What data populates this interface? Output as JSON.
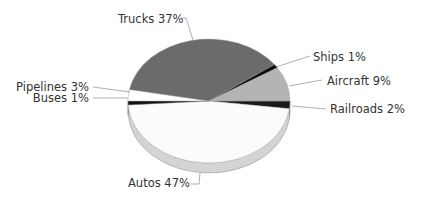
{
  "chart_data": {
    "type": "pie",
    "style": "3d-tilted",
    "title": "",
    "start_angle_deg": 0,
    "direction": "clockwise",
    "slices": [
      {
        "label": "Railroads",
        "value": 2,
        "color": "#1a1a1a",
        "side": "#0f0f0f",
        "text": "Railroads 2%",
        "lx": 330,
        "ly": 113,
        "anchor": "start",
        "line": [
          [
            292,
            106
          ],
          [
            326,
            109
          ]
        ]
      },
      {
        "label": "Autos",
        "value": 47,
        "color": "#fbfbfb",
        "side": "#d4d4d4",
        "text": "Autos 47%",
        "lx": 128,
        "ly": 187,
        "anchor": "start",
        "line": [
          [
            200,
            173
          ],
          [
            199,
            184
          ],
          [
            191,
            184
          ]
        ]
      },
      {
        "label": "Buses",
        "value": 1,
        "color": "#111111",
        "side": "#0a0a0a",
        "text": "Buses 1%",
        "lx": 89,
        "ly": 102,
        "anchor": "end",
        "line": [
          [
            93,
            98
          ],
          [
            128,
            98
          ]
        ]
      },
      {
        "label": "Pipelines",
        "value": 3,
        "color": "#ffffff",
        "side": "#e6e6e6",
        "text": "Pipelines 3%",
        "lx": 89,
        "ly": 91,
        "anchor": "end",
        "line": [
          [
            93,
            87
          ],
          [
            130,
            92
          ]
        ]
      },
      {
        "label": "Trucks",
        "value": 37,
        "color": "#6b6b6b",
        "side": "#555555",
        "text": "Trucks 37%",
        "lx": 118,
        "ly": 23,
        "anchor": "start",
        "line": [
          [
            181,
            18
          ],
          [
            186,
            18
          ],
          [
            193,
            40
          ]
        ]
      },
      {
        "label": "Ships",
        "value": 1,
        "color": "#0d0d0d",
        "side": "#050505",
        "text": "Ships 1%",
        "lx": 313,
        "ly": 61,
        "anchor": "start",
        "line": [
          [
            310,
            56
          ],
          [
            276,
            67
          ]
        ]
      },
      {
        "label": "Aircraft",
        "value": 9,
        "color": "#b4b4b4",
        "side": "#9c9c9c",
        "text": "Aircraft 9%",
        "lx": 327,
        "ly": 85,
        "anchor": "start",
        "line": [
          [
            322,
            80
          ],
          [
            289,
            86
          ]
        ]
      }
    ],
    "legend": "none",
    "units": "percent"
  }
}
